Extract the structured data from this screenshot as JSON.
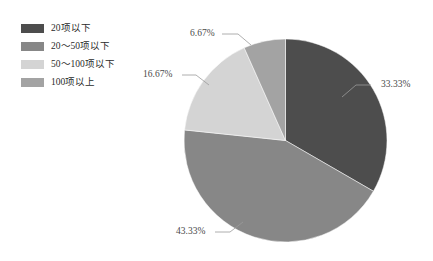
{
  "legend": {
    "position": "top-left",
    "items": [
      {
        "label": "20项以下",
        "color": "#4d4d4d"
      },
      {
        "label": "20～50项以下",
        "color": "#878787"
      },
      {
        "label": "50～100项以下",
        "color": "#d4d4d4"
      },
      {
        "label": "100项以上",
        "color": "#a3a3a3"
      }
    ]
  },
  "labels": {
    "slice1": "33.33%",
    "slice2": "43.33%",
    "slice3": "16.67%",
    "slice4": "6.67%"
  },
  "chart_data": {
    "type": "pie",
    "title": "",
    "categories": [
      "20项以下",
      "20～50项以下",
      "50～100项以下",
      "100项以上"
    ],
    "values": [
      33.33,
      43.33,
      16.67,
      6.67
    ],
    "value_unit": "%",
    "data_labels": [
      "33.33%",
      "43.33%",
      "16.67%",
      "6.67%"
    ],
    "colors": [
      "#4d4d4d",
      "#878787",
      "#d4d4d4",
      "#a3a3a3"
    ],
    "start_angle": 0,
    "direction": "clockwise",
    "legend": "top-left",
    "grid": false
  }
}
